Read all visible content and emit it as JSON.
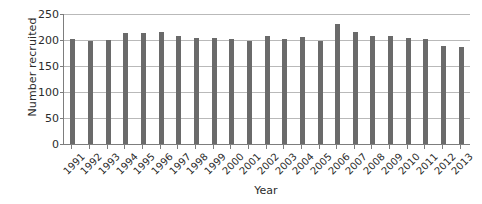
{
  "chart_data": {
    "type": "bar",
    "title": "",
    "xlabel": "Year",
    "ylabel": "Number recruited",
    "categories": [
      "1991",
      "1992",
      "1993",
      "1994",
      "1995",
      "1996",
      "1997",
      "1998",
      "1999",
      "2000",
      "2001",
      "2002",
      "2003",
      "2004",
      "2005",
      "2006",
      "2007",
      "2008",
      "2009",
      "2010",
      "2011",
      "2012",
      "2013"
    ],
    "values": [
      202,
      199,
      200,
      213,
      214,
      216,
      207,
      203,
      204,
      202,
      199,
      208,
      201,
      205,
      199,
      230,
      215,
      208,
      207,
      204,
      201,
      188,
      186
    ],
    "ylim": [
      0,
      250
    ],
    "yticks": [
      0,
      50,
      100,
      150,
      200,
      250
    ],
    "ytick_labels": [
      "0",
      "50",
      "100",
      "150",
      "200",
      "250"
    ],
    "grid": true,
    "grid_axis": "y",
    "legend": false,
    "bar_color": "#6a6a6a",
    "grid_color": "#b9b9b9",
    "axis_color": "#7d7d7d",
    "text_color": "#2b2b2b",
    "background": "#ffffff"
  }
}
